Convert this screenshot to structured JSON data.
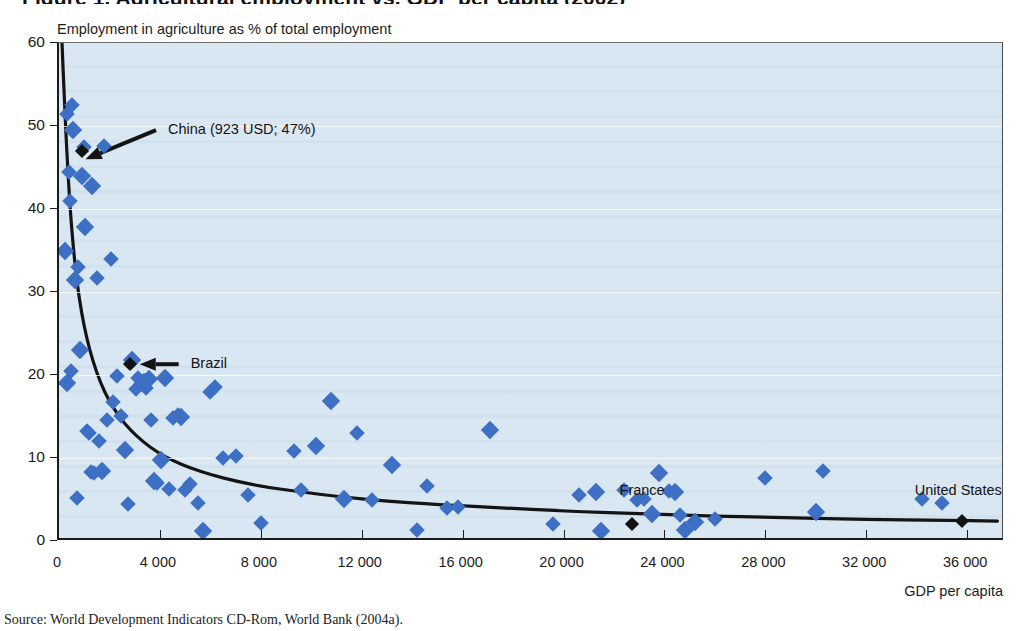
{
  "figure": {
    "title": "Figure 1. Agricultural employment vs. GDP per capita (2002)",
    "source": "Source: World Development Indicators CD-Rom, World Bank (2004a)."
  },
  "chart_data": {
    "type": "scatter",
    "title": "Employment in agriculture as % of total employment",
    "xlabel": "GDP per capita",
    "ylabel": "Employment in agriculture as % of total employment",
    "xlim": [
      0,
      37500
    ],
    "ylim": [
      0,
      60
    ],
    "xticks": [
      0,
      4000,
      8000,
      12000,
      16000,
      20000,
      24000,
      28000,
      32000,
      36000
    ],
    "xticklabels": [
      "0",
      "4 000",
      "8 000",
      "12 000",
      "16 000",
      "20 000",
      "24 000",
      "28 000",
      "32 000",
      "36 000"
    ],
    "yticks": [
      0,
      10,
      20,
      30,
      40,
      50,
      60
    ],
    "yticklabels": [
      "0",
      "10",
      "20",
      "30",
      "40",
      "50",
      "60"
    ],
    "grid": "horizontal-faint",
    "legend": "none",
    "marker_color": "#3d6fc4",
    "highlight_color": "#121212",
    "plot_background": "#d9e7f3",
    "series": [
      {
        "name": "Countries",
        "marker": "diamond",
        "points": [
          [
            250,
            35.0
          ],
          [
            300,
            51.5
          ],
          [
            330,
            19.0
          ],
          [
            380,
            44.5
          ],
          [
            420,
            41.0
          ],
          [
            460,
            20.5
          ],
          [
            500,
            52.5
          ],
          [
            560,
            49.5
          ],
          [
            620,
            31.5
          ],
          [
            700,
            5.2
          ],
          [
            760,
            33.0
          ],
          [
            820,
            23.0
          ],
          [
            900,
            44.0
          ],
          [
            980,
            47.5
          ],
          [
            1050,
            37.8
          ],
          [
            1120,
            13.2
          ],
          [
            1180,
            13.0
          ],
          [
            1250,
            8.3
          ],
          [
            1320,
            42.8
          ],
          [
            1400,
            8.2
          ],
          [
            1500,
            31.7
          ],
          [
            1600,
            12.0
          ],
          [
            1700,
            8.4
          ],
          [
            1800,
            47.6
          ],
          [
            1900,
            14.6
          ],
          [
            2050,
            34.0
          ],
          [
            2150,
            16.8
          ],
          [
            2300,
            19.9
          ],
          [
            2450,
            15.1
          ],
          [
            2600,
            11.0
          ],
          [
            2750,
            4.4
          ],
          [
            2900,
            21.8
          ],
          [
            3050,
            18.3
          ],
          [
            3150,
            19.6
          ],
          [
            3250,
            18.9
          ],
          [
            3350,
            19.2
          ],
          [
            3450,
            18.4
          ],
          [
            3550,
            19.5
          ],
          [
            3650,
            14.6
          ],
          [
            3750,
            7.2
          ],
          [
            3900,
            7.0
          ],
          [
            4050,
            9.7
          ],
          [
            4200,
            19.6
          ],
          [
            4350,
            6.3
          ],
          [
            4500,
            14.8
          ],
          [
            4700,
            15.2
          ],
          [
            4850,
            14.9
          ],
          [
            5000,
            6.2
          ],
          [
            5200,
            6.9
          ],
          [
            5500,
            4.6
          ],
          [
            5700,
            1.2
          ],
          [
            6000,
            17.9
          ],
          [
            6200,
            18.6
          ],
          [
            6500,
            10.0
          ],
          [
            7000,
            10.2
          ],
          [
            7500,
            5.6
          ],
          [
            8000,
            2.2
          ],
          [
            9300,
            10.8
          ],
          [
            9600,
            6.2
          ],
          [
            10200,
            11.5
          ],
          [
            10800,
            16.9
          ],
          [
            11300,
            5.1
          ],
          [
            11800,
            13.0
          ],
          [
            12400,
            5.0
          ],
          [
            13200,
            9.2
          ],
          [
            14200,
            1.3
          ],
          [
            14600,
            6.6
          ],
          [
            15400,
            4.0
          ],
          [
            15800,
            4.1
          ],
          [
            17100,
            13.4
          ],
          [
            19600,
            2.1
          ],
          [
            20600,
            5.5
          ],
          [
            21300,
            5.9
          ],
          [
            21500,
            1.2
          ],
          [
            22400,
            6.2
          ],
          [
            22900,
            5.0
          ],
          [
            23200,
            5.1
          ],
          [
            23500,
            3.3
          ],
          [
            23800,
            8.2
          ],
          [
            24200,
            6.0
          ],
          [
            24400,
            5.9
          ],
          [
            24600,
            3.1
          ],
          [
            24800,
            1.3
          ],
          [
            25200,
            2.3
          ],
          [
            26000,
            2.7
          ],
          [
            28000,
            7.6
          ],
          [
            30000,
            3.5
          ],
          [
            30300,
            8.4
          ],
          [
            34200,
            5.1
          ],
          [
            35000,
            4.6
          ]
        ]
      },
      {
        "name": "Highlighted countries",
        "marker": "diamond-black",
        "points": [
          {
            "x": 923,
            "y": 47,
            "label": "China (923 USD; 47%)",
            "anno": "china"
          },
          {
            "x": 2800,
            "y": 21.3,
            "label": "Brazil",
            "anno": "brazil"
          },
          {
            "x": 22700,
            "y": 2.0,
            "label": "France",
            "anno": "france"
          },
          {
            "x": 35800,
            "y": 2.4,
            "label": "United States",
            "anno": "united-states"
          }
        ]
      }
    ],
    "trendline": {
      "name": "Fitted power curve",
      "color": "#141414",
      "points": [
        [
          120,
          60.0
        ],
        [
          200,
          54.0
        ],
        [
          300,
          47.5
        ],
        [
          420,
          41.0
        ],
        [
          560,
          35.5
        ],
        [
          720,
          31.0
        ],
        [
          900,
          27.4
        ],
        [
          1100,
          24.4
        ],
        [
          1350,
          21.6
        ],
        [
          1650,
          19.0
        ],
        [
          2000,
          16.8
        ],
        [
          2400,
          14.9
        ],
        [
          2850,
          13.3
        ],
        [
          3350,
          11.9
        ],
        [
          3900,
          10.7
        ],
        [
          4500,
          9.7
        ],
        [
          5200,
          8.8
        ],
        [
          6000,
          8.0
        ],
        [
          7000,
          7.2
        ],
        [
          8200,
          6.5
        ],
        [
          9600,
          5.9
        ],
        [
          11200,
          5.3
        ],
        [
          13000,
          4.8
        ],
        [
          15000,
          4.4
        ],
        [
          17500,
          4.0
        ],
        [
          20000,
          3.6
        ],
        [
          23000,
          3.3
        ],
        [
          26000,
          3.0
        ],
        [
          29000,
          2.8
        ],
        [
          32000,
          2.6
        ],
        [
          35000,
          2.5
        ],
        [
          37200,
          2.4
        ]
      ]
    },
    "annotations": [
      {
        "name": "china",
        "text": "China (923 USD; 47%)",
        "x": 4400,
        "y": 49.5,
        "arrow_to": [
          1050,
          46.0
        ]
      },
      {
        "name": "brazil",
        "text": "Brazil",
        "x": 5300,
        "y": 21.3,
        "arrow_to": [
          3200,
          21.3
        ]
      },
      {
        "name": "france",
        "text": "France",
        "x": 22300,
        "y": 6.0,
        "arrow_to": null
      },
      {
        "name": "united-states",
        "text": "United States",
        "x": 34000,
        "y": 6.0,
        "arrow_to": null
      }
    ]
  }
}
